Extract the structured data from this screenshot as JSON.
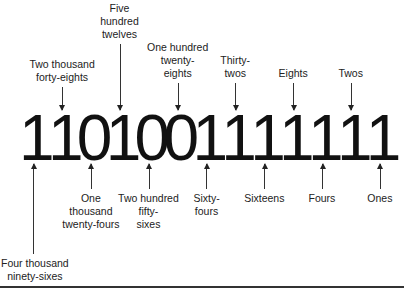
{
  "binary_number": "1101001111111",
  "digits": [
    "1",
    "1",
    "0",
    "1",
    "0",
    "0",
    "1",
    "1",
    "1",
    "1",
    "1",
    "1",
    "1"
  ],
  "labels_above": [
    {
      "text": "Two thousand\nforty-eights",
      "digit_index": 1
    },
    {
      "text": "Five\nhundred\ntwelves",
      "digit_index": 3
    },
    {
      "text": "One hundred\ntwenty-\neights",
      "digit_index": 5
    },
    {
      "text": "Thirty-\ntwos",
      "digit_index": 7
    },
    {
      "text": "Eights",
      "digit_index": 9
    },
    {
      "text": "Twos",
      "digit_index": 11
    }
  ],
  "labels_below": [
    {
      "text": "Four thousand\nninety-sixes",
      "digit_index": 0
    },
    {
      "text": "One\nthousand\ntwenty-fours",
      "digit_index": 2
    },
    {
      "text": "Two hundred\nfifty-\nsixes",
      "digit_index": 4
    },
    {
      "text": "Sixty-\nfours",
      "digit_index": 6
    },
    {
      "text": "Sixteens",
      "digit_index": 8
    },
    {
      "text": "Fours",
      "digit_index": 10
    },
    {
      "text": "Ones",
      "digit_index": 12
    }
  ]
}
